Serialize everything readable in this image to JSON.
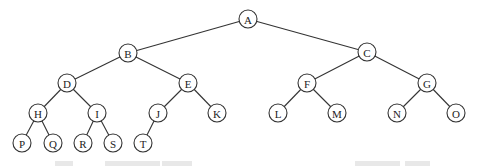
{
  "diagram": {
    "type": "binary-tree",
    "colors": {
      "line": "#333333",
      "node_fill": "#ffffff",
      "text": "#222222"
    },
    "node_radius": 9,
    "nodes": [
      {
        "id": "A",
        "label": "A",
        "x": 248,
        "y": 19
      },
      {
        "id": "B",
        "label": "B",
        "x": 128,
        "y": 53
      },
      {
        "id": "C",
        "label": "C",
        "x": 367,
        "y": 52
      },
      {
        "id": "D",
        "label": "D",
        "x": 67,
        "y": 83
      },
      {
        "id": "E",
        "label": "E",
        "x": 188,
        "y": 83
      },
      {
        "id": "F",
        "label": "F",
        "x": 307,
        "y": 83
      },
      {
        "id": "G",
        "label": "G",
        "x": 427,
        "y": 83
      },
      {
        "id": "H",
        "label": "H",
        "x": 38,
        "y": 113
      },
      {
        "id": "I",
        "label": "I",
        "x": 97,
        "y": 113
      },
      {
        "id": "J",
        "label": "J",
        "x": 158,
        "y": 113
      },
      {
        "id": "K",
        "label": "K",
        "x": 217,
        "y": 113
      },
      {
        "id": "L",
        "label": "L",
        "x": 278,
        "y": 113
      },
      {
        "id": "M",
        "label": "M",
        "x": 337,
        "y": 113
      },
      {
        "id": "N",
        "label": "N",
        "x": 397,
        "y": 113
      },
      {
        "id": "O",
        "label": "O",
        "x": 456,
        "y": 113
      },
      {
        "id": "P",
        "label": "P",
        "x": 22,
        "y": 143
      },
      {
        "id": "Q",
        "label": "Q",
        "x": 53,
        "y": 143
      },
      {
        "id": "R",
        "label": "R",
        "x": 83,
        "y": 143
      },
      {
        "id": "S",
        "label": "S",
        "x": 113,
        "y": 143
      },
      {
        "id": "T",
        "label": "T",
        "x": 143,
        "y": 143
      }
    ],
    "edges": [
      [
        "A",
        "B"
      ],
      [
        "A",
        "C"
      ],
      [
        "B",
        "D"
      ],
      [
        "B",
        "E"
      ],
      [
        "C",
        "F"
      ],
      [
        "C",
        "G"
      ],
      [
        "D",
        "H"
      ],
      [
        "D",
        "I"
      ],
      [
        "E",
        "J"
      ],
      [
        "E",
        "K"
      ],
      [
        "F",
        "L"
      ],
      [
        "F",
        "M"
      ],
      [
        "G",
        "N"
      ],
      [
        "G",
        "O"
      ],
      [
        "H",
        "P"
      ],
      [
        "H",
        "Q"
      ],
      [
        "I",
        "R"
      ],
      [
        "I",
        "S"
      ],
      [
        "J",
        "T"
      ]
    ],
    "caption_cropped": true
  }
}
